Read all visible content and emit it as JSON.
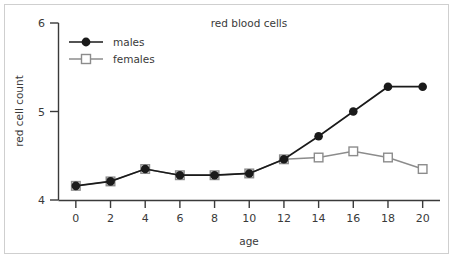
{
  "chart_data": {
    "type": "line",
    "title": "red blood cells",
    "xlabel": "age",
    "ylabel": "red cell count",
    "x": [
      0,
      2,
      4,
      6,
      8,
      10,
      12,
      14,
      16,
      18,
      20
    ],
    "xlim": [
      -1,
      21
    ],
    "ylim": [
      4,
      6
    ],
    "xticks": [
      "0",
      "2",
      "4",
      "6",
      "8",
      "10",
      "12",
      "14",
      "16",
      "18",
      "20"
    ],
    "yticks": [
      "4",
      "5",
      "6"
    ],
    "ytick_values": [
      4,
      5,
      6
    ],
    "grid": false,
    "legend_position": "top-left",
    "series": [
      {
        "name": "males",
        "color": "#1a1a1a",
        "marker": "filled-circle",
        "values": [
          4.16,
          4.21,
          4.35,
          4.28,
          4.28,
          4.3,
          4.46,
          4.72,
          5.0,
          5.28,
          5.28
        ]
      },
      {
        "name": "females",
        "color": "#8c8c8c",
        "marker": "open-square",
        "values": [
          4.16,
          4.21,
          4.35,
          4.28,
          4.28,
          4.3,
          4.46,
          4.48,
          4.55,
          4.48,
          4.35
        ]
      }
    ]
  },
  "legend": {
    "entries": [
      {
        "label": "males"
      },
      {
        "label": "females"
      }
    ]
  },
  "colors": {
    "males": "#1a1a1a",
    "females": "#8c8c8c",
    "axis": "#3a3a3a",
    "frame": "#cfcfcf",
    "background": "#ffffff"
  }
}
